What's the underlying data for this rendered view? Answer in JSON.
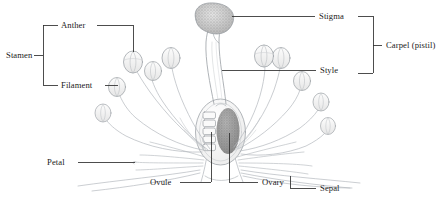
{
  "diagram": {
    "style": "pencil line drawing, greyscale",
    "background_color": "#ffffff",
    "line_color": "#9aa0a6",
    "leader_color": "#3a3a3a",
    "text_color": "#1a1a1a"
  },
  "labels": {
    "stamen": "Stamen",
    "anther": "Anther",
    "filament": "Filament",
    "stigma": "Stigma",
    "carpel": "Carpel (pistil)",
    "style": "Style",
    "petal": "Petal",
    "ovule": "Ovule",
    "ovary": "Ovary",
    "sepal": "Sepal"
  },
  "groups": {
    "stamen_members": [
      "Anther",
      "Filament"
    ],
    "carpel_members": [
      "Stigma",
      "Style"
    ]
  },
  "parts": [
    {
      "name": "Stigma",
      "group": "Carpel (pistil)",
      "side": "right"
    },
    {
      "name": "Style",
      "group": "Carpel (pistil)",
      "side": "right"
    },
    {
      "name": "Anther",
      "group": "Stamen",
      "side": "left"
    },
    {
      "name": "Filament",
      "group": "Stamen",
      "side": "left"
    },
    {
      "name": "Petal",
      "group": "",
      "side": "left"
    },
    {
      "name": "Ovule",
      "group": "",
      "side": "bottom"
    },
    {
      "name": "Ovary",
      "group": "",
      "side": "bottom"
    },
    {
      "name": "Sepal",
      "group": "",
      "side": "bottom"
    }
  ]
}
